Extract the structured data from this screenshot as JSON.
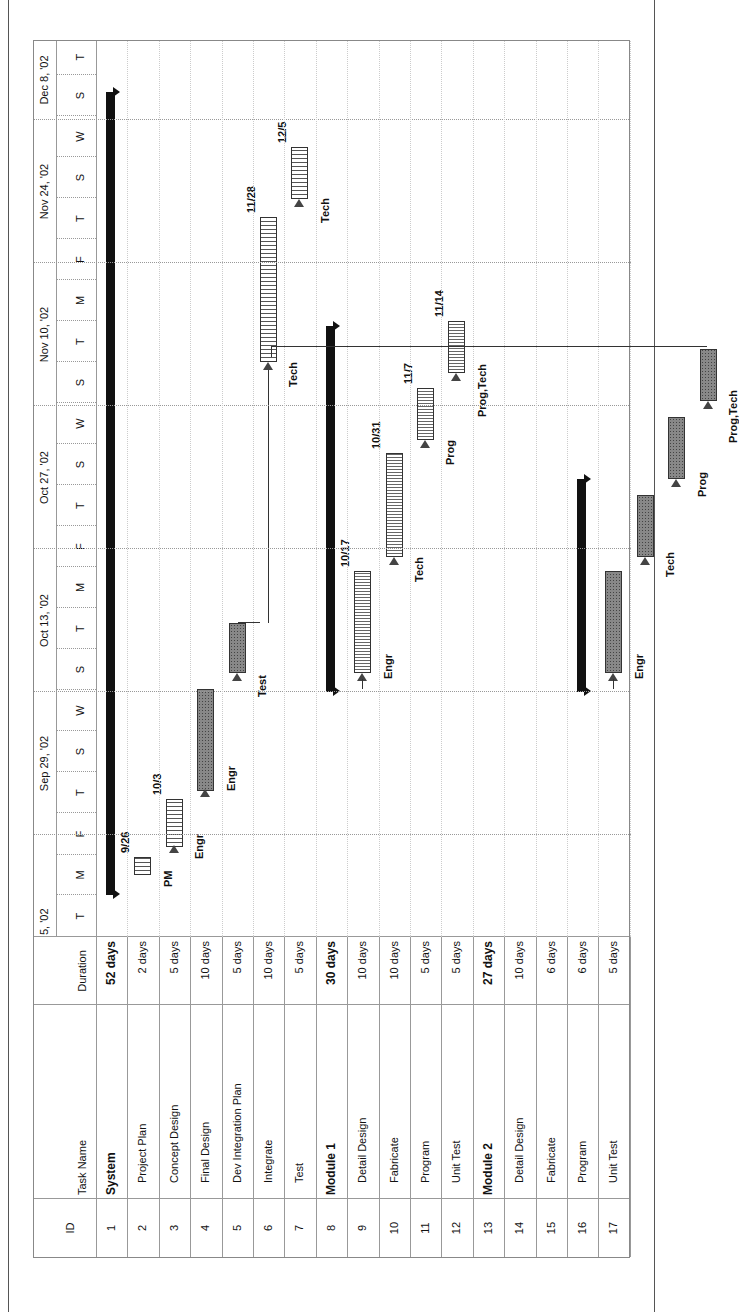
{
  "table": {
    "headers": {
      "id": "ID",
      "task_name": "Task Name",
      "duration": "Duration"
    },
    "rows": [
      {
        "id": "1",
        "name": "System",
        "duration": "52 days",
        "summary": true
      },
      {
        "id": "2",
        "name": "Project Plan",
        "duration": "2 days"
      },
      {
        "id": "3",
        "name": "Concept Design",
        "duration": "5 days"
      },
      {
        "id": "4",
        "name": "Final Design",
        "duration": "10 days"
      },
      {
        "id": "5",
        "name": "Dev Integration Plan",
        "duration": "5 days"
      },
      {
        "id": "6",
        "name": "Integrate",
        "duration": "10 days"
      },
      {
        "id": "7",
        "name": "Test",
        "duration": "5 days"
      },
      {
        "id": "8",
        "name": "Module 1",
        "duration": "30 days",
        "summary": true
      },
      {
        "id": "9",
        "name": "Detail Design",
        "duration": "10 days"
      },
      {
        "id": "10",
        "name": "Fabricate",
        "duration": "10 days"
      },
      {
        "id": "11",
        "name": "Program",
        "duration": "5 days"
      },
      {
        "id": "12",
        "name": "Unit Test",
        "duration": "5 days"
      },
      {
        "id": "13",
        "name": "Module 2",
        "duration": "27 days",
        "summary": true
      },
      {
        "id": "14",
        "name": "Detail Design",
        "duration": "10 days"
      },
      {
        "id": "15",
        "name": "Fabricate",
        "duration": "6 days"
      },
      {
        "id": "16",
        "name": "Program",
        "duration": "6 days"
      },
      {
        "id": "17",
        "name": "Unit Test",
        "duration": "5 days"
      }
    ]
  },
  "timeline": {
    "major": [
      "5, '02",
      "Sep 29, '02",
      "Oct 13, '02",
      "Oct 27, '02",
      "Nov 10, '02",
      "Nov 24, '02",
      "Dec 8, '02"
    ],
    "minor": [
      "T",
      "M",
      "F",
      "T",
      "S",
      "W",
      "S",
      "T",
      "M",
      "F",
      "T",
      "S",
      "W",
      "S",
      "T",
      "M",
      "F",
      "T",
      "S",
      "W",
      "S",
      "T"
    ]
  },
  "chart_data": {
    "type": "gantt",
    "title": "",
    "orientation": "rotated -90 degrees",
    "timescale": {
      "major_ticks": [
        "Sep 15, '02 (partial)",
        "Sep 29, '02",
        "Oct 13, '02",
        "Oct 27, '02",
        "Nov 10, '02",
        "Nov 24, '02",
        "Dec 8, '02"
      ],
      "minor_ticks": [
        "T",
        "M",
        "F",
        "T",
        "S",
        "W",
        "S",
        "T",
        "M",
        "F",
        "T",
        "S",
        "W",
        "S",
        "T",
        "M",
        "F",
        "T",
        "S",
        "W",
        "S",
        "T"
      ]
    },
    "tasks": [
      {
        "id": 1,
        "name": "System",
        "duration_days": 52,
        "type": "summary"
      },
      {
        "id": 2,
        "name": "Project Plan",
        "duration_days": 2,
        "resource": "PM",
        "finish_label": "9/26",
        "style": "hatched"
      },
      {
        "id": 3,
        "name": "Concept Design",
        "duration_days": 5,
        "resource": "Engr",
        "finish_label": "10/3",
        "style": "hatched"
      },
      {
        "id": 4,
        "name": "Final Design",
        "duration_days": 10,
        "resource": "Engr",
        "style": "critical"
      },
      {
        "id": 5,
        "name": "Dev Integration Plan",
        "duration_days": 5,
        "resource": "Test",
        "style": "critical"
      },
      {
        "id": 6,
        "name": "Integrate",
        "duration_days": 10,
        "resource": "Tech",
        "finish_label": "11/28",
        "style": "hatched"
      },
      {
        "id": 7,
        "name": "Test",
        "duration_days": 5,
        "resource": "Tech",
        "finish_label": "12/5",
        "style": "hatched"
      },
      {
        "id": 8,
        "name": "Module 1",
        "duration_days": 30,
        "type": "summary"
      },
      {
        "id": 9,
        "name": "Detail Design",
        "duration_days": 10,
        "resource": "Engr",
        "finish_label": "10/17",
        "style": "hatched"
      },
      {
        "id": 10,
        "name": "Fabricate",
        "duration_days": 10,
        "resource": "Tech",
        "finish_label": "10/31",
        "style": "hatched"
      },
      {
        "id": 11,
        "name": "Program",
        "duration_days": 5,
        "resource": "Prog",
        "finish_label": "11/7",
        "style": "hatched"
      },
      {
        "id": 12,
        "name": "Unit Test",
        "duration_days": 5,
        "resource": "Prog,Tech",
        "finish_label": "11/14",
        "style": "hatched"
      },
      {
        "id": 13,
        "name": "Module 2",
        "duration_days": 27,
        "type": "summary"
      },
      {
        "id": 14,
        "name": "Detail Design",
        "duration_days": 10,
        "resource": "Engr",
        "style": "critical"
      },
      {
        "id": 15,
        "name": "Fabricate",
        "duration_days": 6,
        "resource": "Tech",
        "style": "critical"
      },
      {
        "id": 16,
        "name": "Program",
        "duration_days": 6,
        "resource": "Prog",
        "style": "critical"
      },
      {
        "id": 17,
        "name": "Unit Test",
        "duration_days": 5,
        "resource": "Prog,Tech",
        "style": "critical"
      }
    ]
  },
  "bars": {
    "labels": {
      "pm": "PM",
      "engr": "Engr",
      "test": "Test",
      "tech": "Tech",
      "prog": "Prog",
      "progtech": "Prog,Tech",
      "d926": "9/26",
      "d103": "10/3",
      "d1017": "10/17",
      "d1031": "10/31",
      "d117": "11/7",
      "d1114": "11/14",
      "d1128": "11/28",
      "d125": "12/5"
    }
  }
}
